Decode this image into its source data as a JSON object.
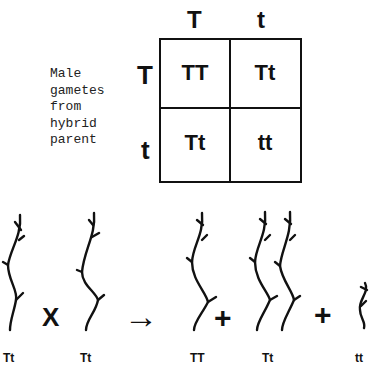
{
  "punnett_square": {
    "column_headers": [
      "T",
      "t"
    ],
    "row_headers": [
      "T",
      "t"
    ],
    "cells": [
      [
        "TT",
        "Tt"
      ],
      [
        "Tt",
        "tt"
      ]
    ],
    "side_label_lines": [
      "Male",
      "gametes",
      "from",
      "hybrid",
      "parent"
    ]
  },
  "cross": {
    "parents": [
      {
        "genotype": "Tt",
        "phenotype": "tall"
      },
      {
        "genotype": "Tt",
        "phenotype": "tall"
      }
    ],
    "cross_symbol": "X",
    "arrow_symbol": "→",
    "plus_symbol": "+",
    "offspring": [
      {
        "genotype": "TT",
        "phenotype": "tall",
        "count": 1
      },
      {
        "genotype": "Tt",
        "phenotype": "tall",
        "count": 2
      },
      {
        "genotype": "tt",
        "phenotype": "short",
        "count": 1
      }
    ]
  },
  "colors": {
    "ink": "#111111",
    "background": "#ffffff"
  }
}
